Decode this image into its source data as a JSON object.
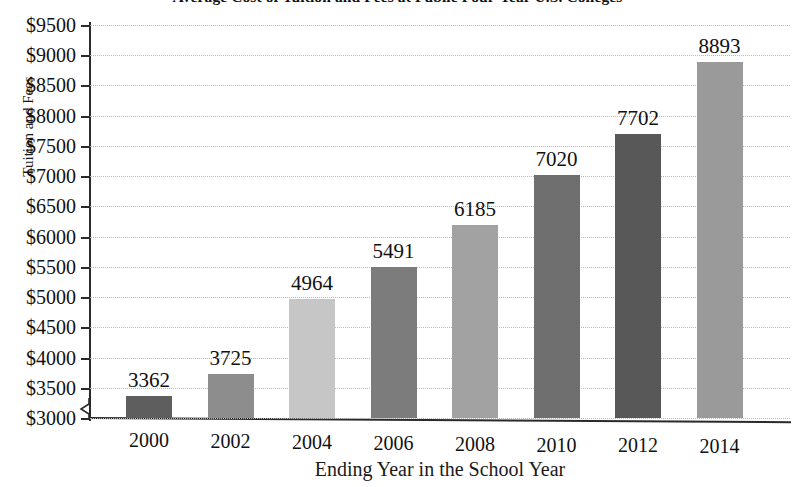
{
  "chart_data": {
    "type": "bar",
    "title": "Average Cost of Tuition and Fees at Public Four-Year U.S. Colleges",
    "xlabel": "Ending Year in the School Year",
    "ylabel": "Tuition and Fees",
    "categories": [
      "2000",
      "2002",
      "2004",
      "2006",
      "2008",
      "2010",
      "2012",
      "2014"
    ],
    "values": [
      3362,
      3725,
      4964,
      5491,
      6185,
      7020,
      7702,
      8893
    ],
    "value_labels": [
      "3362",
      "3725",
      "4964",
      "5491",
      "6185",
      "7020",
      "7702",
      "8893"
    ],
    "bar_colors": [
      "#5e5e5e",
      "#8d8d8d",
      "#c6c6c6",
      "#7c7c7c",
      "#a2a2a2",
      "#6f6f6f",
      "#585858",
      "#9a9a9a"
    ],
    "ylim": [
      3000,
      9500
    ],
    "ytick_step": 500,
    "ytick_labels": [
      "$9500",
      "$9000",
      "$8500",
      "$8000",
      "$7500",
      "$7000",
      "$6500",
      "$6000",
      "$5500",
      "$5000",
      "$4500",
      "$4000",
      "$3500",
      "$3000"
    ],
    "ytick_values": [
      9500,
      9000,
      8500,
      8000,
      7500,
      7000,
      6500,
      6000,
      5500,
      5000,
      4500,
      4000,
      3500,
      3000
    ],
    "grid": true,
    "grid_axis": "y",
    "legend": "none",
    "axis_break": true,
    "axis_break_note": "y-axis broken below $3000",
    "axis_color": "#2a2a2a",
    "grid_color": "#b9b9b9",
    "background_color": "#ffffff"
  }
}
